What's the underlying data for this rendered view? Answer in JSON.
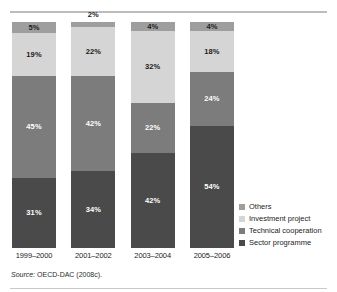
{
  "figure": {
    "caption_remnant": "",
    "source_prefix": "Source:",
    "source_text": "OECD-DAC (2008c)."
  },
  "legend": {
    "items": [
      {
        "label": "Others",
        "color": "#9e9e9e"
      },
      {
        "label": "Investment project",
        "color": "#d5d5d5"
      },
      {
        "label": "Technical cooperation",
        "color": "#7c7c7c"
      },
      {
        "label": "Sector programme",
        "color": "#4a4a4a"
      }
    ]
  },
  "chart_data": {
    "type": "bar",
    "stacked": true,
    "stack_total": 100,
    "unit": "%",
    "title": "",
    "xlabel": "",
    "ylabel": "",
    "ylim": [
      0,
      100
    ],
    "grid": false,
    "legend_position": "right",
    "categories": [
      "1999–2000",
      "2001–2002",
      "2003–2004",
      "2005–2006"
    ],
    "series": [
      {
        "name": "Others",
        "color": "#9e9e9e",
        "label_color": "#1c1c1c",
        "values": [
          5,
          2,
          4,
          4
        ],
        "labels": [
          "5%",
          "2%",
          "4%",
          "4%"
        ],
        "label_outside": [
          false,
          true,
          false,
          false
        ]
      },
      {
        "name": "Investment project",
        "color": "#d5d5d5",
        "label_color": "#1c1c1c",
        "values": [
          19,
          22,
          32,
          18
        ],
        "labels": [
          "19%",
          "22%",
          "32%",
          "18%"
        ],
        "label_outside": [
          false,
          false,
          false,
          false
        ]
      },
      {
        "name": "Technical cooperation",
        "color": "#7c7c7c",
        "label_color": "#ffffff",
        "values": [
          45,
          42,
          22,
          24
        ],
        "labels": [
          "45%",
          "42%",
          "22%",
          "24%"
        ],
        "label_outside": [
          false,
          false,
          false,
          false
        ]
      },
      {
        "name": "Sector programme",
        "color": "#4a4a4a",
        "label_color": "#ffffff",
        "values": [
          31,
          34,
          42,
          54
        ],
        "labels": [
          "31%",
          "34%",
          "42%",
          "54%"
        ],
        "label_outside": [
          false,
          false,
          false,
          false
        ]
      }
    ]
  }
}
